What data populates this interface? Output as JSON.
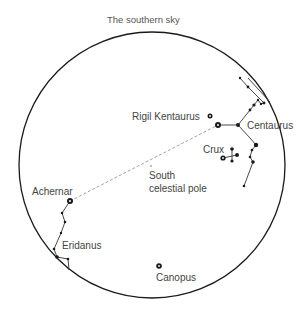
{
  "title": "The southern sky",
  "colors": {
    "ink": "#1a1a1a",
    "label": "#444444",
    "dashed": "#999999"
  },
  "labels": {
    "rigil_kentaurus": "Rigil Kentaurus",
    "centaurus": "Centaurus",
    "crux": "Crux",
    "south_pole_line1": "South",
    "south_pole_line2": "celestial pole",
    "achernar": "Achernar",
    "eridanus": "Eridanus",
    "canopus": "Canopus"
  },
  "sky_circle": {
    "cx": 152,
    "cy": 165,
    "r": 133
  }
}
